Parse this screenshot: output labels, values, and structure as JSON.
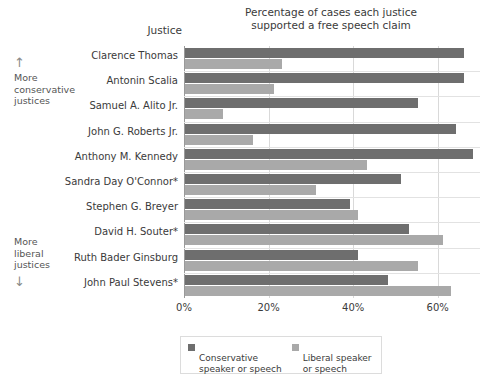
{
  "chart_data": {
    "type": "bar",
    "orientation": "horizontal",
    "title": "Percentage of cases each justice supported a free speech claim",
    "title_line1": "Percentage of cases each justice",
    "title_line2": "supported a free speech claim",
    "category_axis_label": "Justice",
    "xlabel": "",
    "ylabel": "",
    "xlim": [
      0,
      70
    ],
    "xticks": [
      0,
      20,
      40,
      60
    ],
    "xticklabels": [
      "0%",
      "20%",
      "40%",
      "60%"
    ],
    "grid": true,
    "legend_position": "bottom",
    "categories": [
      "Clarence Thomas",
      "Antonin Scalia",
      "Samuel A. Alito Jr.",
      "John G. Roberts Jr.",
      "Anthony M. Kennedy",
      "Sandra Day O'Connor*",
      "Stephen G. Breyer",
      "David H. Souter*",
      "Ruth Bader Ginsburg",
      "John Paul Stevens*"
    ],
    "series": [
      {
        "name": "Conservative speaker or speech",
        "color": "#6e6e6e",
        "values": [
          66,
          66,
          55,
          64,
          68,
          51,
          39,
          53,
          41,
          48
        ]
      },
      {
        "name": "Liberal speaker or speech",
        "color": "#a9a9a9",
        "values": [
          23,
          21,
          9,
          16,
          43,
          31,
          41,
          61,
          55,
          63
        ]
      }
    ],
    "annotations": {
      "top": "More conservative justices",
      "bottom": "More liberal justices"
    }
  },
  "side_notes": {
    "conservative": {
      "arrow": "arrow-up-icon",
      "arrow_glyph": "↑",
      "line1": "More",
      "line2": "conservative",
      "line3": "justices"
    },
    "liberal": {
      "arrow": "arrow-down-icon",
      "arrow_glyph": "↓",
      "line1": "More",
      "line2": "liberal",
      "line3": "justices"
    }
  },
  "legend": {
    "items": [
      {
        "label_line1": "Conservative",
        "label_line2": "speaker or speech",
        "color": "#6e6e6e"
      },
      {
        "label_line1": "Liberal speaker",
        "label_line2": "or speech",
        "color": "#a9a9a9"
      }
    ]
  }
}
